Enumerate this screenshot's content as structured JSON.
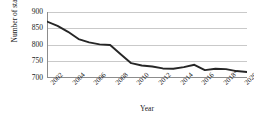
{
  "chart_data": {
    "type": "line",
    "title": "",
    "xlabel": "Year",
    "ylabel": "Number of staff",
    "ylim": [
      700,
      900
    ],
    "yticks": [
      700,
      750,
      800,
      850,
      900
    ],
    "ytick_labels": [
      "700",
      "750",
      "800",
      "850",
      "900"
    ],
    "grid": true,
    "legend": "none",
    "xlim": [
      2002,
      2021
    ],
    "xtick_labels": [
      "2002",
      "2004",
      "2006",
      "2008",
      "2010",
      "2012",
      "2014",
      "2016",
      "2018*",
      "2020*"
    ],
    "xticks": [
      2002,
      2004,
      2006,
      2008,
      2010,
      2012,
      2014,
      2016,
      2018,
      2020
    ],
    "x": [
      2002,
      2003,
      2004,
      2005,
      2006,
      2007,
      2008,
      2009,
      2010,
      2011,
      2012,
      2013,
      2014,
      2015,
      2016,
      2017,
      2018,
      2019,
      2020,
      2021
    ],
    "values": [
      871,
      858,
      840,
      818,
      808,
      802,
      800,
      772,
      745,
      738,
      735,
      729,
      728,
      733,
      740,
      724,
      728,
      727,
      721,
      718
    ],
    "series": [
      {
        "name": "Number of staff",
        "color": "#262626",
        "values": [
          871,
          858,
          840,
          818,
          808,
          802,
          800,
          772,
          745,
          738,
          735,
          729,
          728,
          733,
          740,
          724,
          728,
          727,
          721,
          718
        ]
      }
    ],
    "line_color": "#262626",
    "grid_color": "#c9c9c9",
    "axis_color": "#7f7f7f",
    "footnote_marker": "*"
  },
  "axes": {
    "y_title": "Number of staff",
    "x_title": "Year"
  }
}
